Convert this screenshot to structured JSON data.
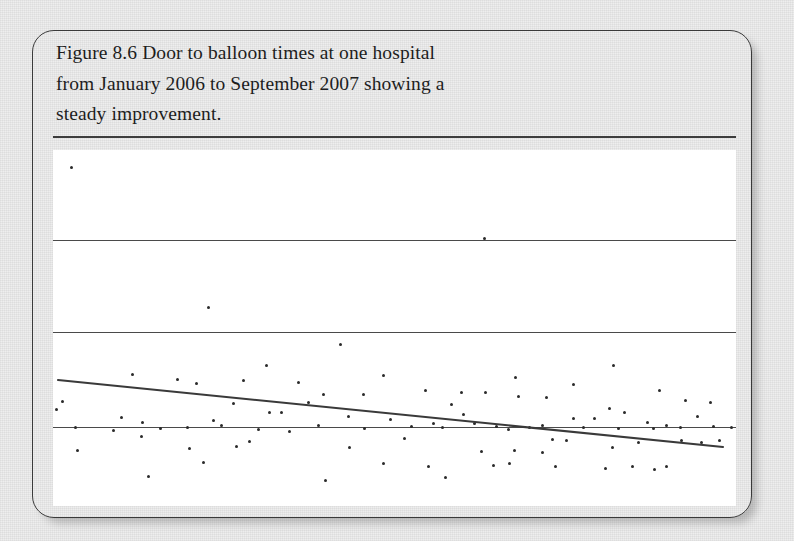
{
  "figure": {
    "caption_lines": [
      "Figure 8.6 Door to balloon times at one hospital",
      "from January 2006 to September 2007 showing a",
      "steady improvement."
    ],
    "caption_full": "Figure 8.6 Door to balloon times at one hospital from January 2006 to September 2007 showing a steady improvement."
  },
  "colors": {
    "page_background": "#ececec",
    "card_border": "#3a3a3a",
    "panel_background": "#ffffff",
    "gridline": "#4a4a4a",
    "point": "#2a2a2a",
    "trend_line": "#3a3a3a",
    "caption_text": "#1d1d1d"
  },
  "chart_data": {
    "type": "scatter",
    "title": "Figure 8.6 Door to balloon times at one hospital from January 2006 to September 2007 showing a steady improvement.",
    "xlabel": "",
    "ylabel": "",
    "xlim": [
      0,
      683
    ],
    "ylim": [
      0,
      356
    ],
    "grid": true,
    "grid_orientation": "horizontal",
    "legend": "none",
    "axis_tick_labels": [],
    "gridlines_y": [
      90,
      182,
      277
    ],
    "trend_line": {
      "name": "linear trend",
      "x0": 5,
      "y0": 230,
      "x1": 670,
      "y1": 297,
      "direction": "decreasing",
      "color": "#3a3a3a"
    },
    "points": [
      [
        18,
        17
      ],
      [
        431,
        88
      ],
      [
        155,
        157
      ],
      [
        287,
        194
      ],
      [
        213,
        215
      ],
      [
        79,
        224
      ],
      [
        190,
        230
      ],
      [
        245,
        232
      ],
      [
        330,
        225
      ],
      [
        310,
        244
      ],
      [
        408,
        242
      ],
      [
        432,
        242
      ],
      [
        462,
        227
      ],
      [
        520,
        234
      ],
      [
        560,
        215
      ],
      [
        372,
        240
      ],
      [
        124,
        229
      ],
      [
        9,
        251
      ],
      [
        143,
        233
      ],
      [
        180,
        253
      ],
      [
        255,
        252
      ],
      [
        270,
        244
      ],
      [
        398,
        254
      ],
      [
        465,
        246
      ],
      [
        493,
        247
      ],
      [
        556,
        258
      ],
      [
        606,
        240
      ],
      [
        632,
        250
      ],
      [
        657,
        252
      ],
      [
        3,
        259
      ],
      [
        68,
        267
      ],
      [
        89,
        272
      ],
      [
        160,
        270
      ],
      [
        216,
        262
      ],
      [
        228,
        262
      ],
      [
        295,
        266
      ],
      [
        337,
        269
      ],
      [
        380,
        273
      ],
      [
        410,
        264
      ],
      [
        443,
        276
      ],
      [
        476,
        277
      ],
      [
        520,
        268
      ],
      [
        541,
        268
      ],
      [
        571,
        262
      ],
      [
        594,
        272
      ],
      [
        613,
        275
      ],
      [
        644,
        266
      ],
      [
        22,
        277
      ],
      [
        60,
        280
      ],
      [
        107,
        278
      ],
      [
        134,
        277
      ],
      [
        168,
        275
      ],
      [
        205,
        279
      ],
      [
        236,
        281
      ],
      [
        265,
        275
      ],
      [
        311,
        278
      ],
      [
        358,
        276
      ],
      [
        389,
        277
      ],
      [
        421,
        273
      ],
      [
        455,
        279
      ],
      [
        489,
        275
      ],
      [
        530,
        277
      ],
      [
        565,
        278
      ],
      [
        600,
        278
      ],
      [
        627,
        277
      ],
      [
        660,
        276
      ],
      [
        678,
        277
      ],
      [
        88,
        286
      ],
      [
        196,
        291
      ],
      [
        351,
        288
      ],
      [
        499,
        289
      ],
      [
        513,
        290
      ],
      [
        585,
        292
      ],
      [
        628,
        290
      ],
      [
        648,
        292
      ],
      [
        666,
        290
      ],
      [
        24,
        300
      ],
      [
        136,
        298
      ],
      [
        183,
        296
      ],
      [
        296,
        297
      ],
      [
        428,
        301
      ],
      [
        461,
        300
      ],
      [
        489,
        302
      ],
      [
        559,
        297
      ],
      [
        150,
        312
      ],
      [
        330,
        313
      ],
      [
        375,
        316
      ],
      [
        440,
        315
      ],
      [
        456,
        313
      ],
      [
        502,
        316
      ],
      [
        552,
        318
      ],
      [
        579,
        316
      ],
      [
        601,
        319
      ],
      [
        613,
        316
      ],
      [
        95,
        326
      ],
      [
        272,
        330
      ],
      [
        392,
        327
      ]
    ]
  }
}
